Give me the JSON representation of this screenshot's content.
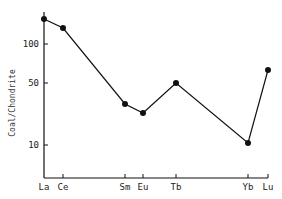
{
  "chart_data": {
    "type": "line",
    "title": "",
    "xlabel": "",
    "ylabel": "Coal/Chondrite",
    "yscale": "log",
    "yticks": [
      10,
      50,
      100
    ],
    "ytick_labels": [
      "10",
      "50",
      "100"
    ],
    "ylim": [
      6,
      180
    ],
    "grid": false,
    "legend": null,
    "categories": [
      "La",
      "Ce",
      "Sm",
      "Eu",
      "Tb",
      "Yb",
      "Lu"
    ],
    "series": [
      {
        "name": "Coal/Chondrite",
        "values": [
          155,
          133,
          29,
          23,
          50,
          10.5,
          63
        ],
        "marker": "filled-circle",
        "color": "#111111"
      }
    ]
  },
  "layout": {
    "axis_x_px": 44,
    "baseline_y_px": 178,
    "x_end_px": 268,
    "ytick_px": {
      "100": 44,
      "50": 83,
      "10": 145
    },
    "category_x_px": {
      "La": 44,
      "Ce": 63,
      "Sm": 125,
      "Eu": 143,
      "Tb": 176,
      "Yb": 248,
      "Lu": 268
    },
    "point_y_px": {
      "La": 19,
      "Ce": 28,
      "Sm": 104,
      "Eu": 113,
      "Tb": 83,
      "Yb": 143,
      "Lu": 70
    }
  }
}
